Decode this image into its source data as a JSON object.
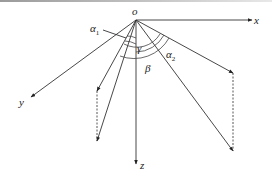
{
  "diagram": {
    "origin": {
      "label": "o",
      "x": 136,
      "y": 20
    },
    "axes": [
      {
        "name": "x",
        "label": "x",
        "to": [
          252,
          20
        ],
        "label_pos": [
          256,
          24
        ]
      },
      {
        "name": "y",
        "label": "y",
        "to": [
          31,
          97
        ],
        "label_pos": [
          20,
          106
        ]
      },
      {
        "name": "z",
        "label": "z",
        "to": [
          136,
          164
        ],
        "label_pos": [
          141,
          170
        ]
      }
    ],
    "angles": {
      "alpha1": {
        "label": "α",
        "sub": "1",
        "label_pos": [
          92,
          32
        ]
      },
      "gamma": {
        "label": "γ",
        "label_pos": [
          137,
          52
        ]
      },
      "alpha2": {
        "label": "α",
        "sub": "2",
        "label_pos": [
          178,
          59
        ]
      },
      "beta": {
        "label": "β",
        "label_pos": [
          143,
          73
        ]
      }
    },
    "vectors": [
      {
        "name": "left-upper",
        "to": [
          97,
          91
        ]
      },
      {
        "name": "left-lower",
        "to": [
          97,
          141
        ]
      },
      {
        "name": "right-upper",
        "to": [
          233,
          73
        ]
      },
      {
        "name": "right-lower",
        "to": [
          233,
          151
        ]
      }
    ],
    "projections": [
      {
        "name": "left-dashed",
        "from": [
          97,
          91
        ],
        "to": [
          97,
          141
        ]
      },
      {
        "name": "right-dashed",
        "from": [
          233,
          73
        ],
        "to": [
          233,
          151
        ]
      }
    ],
    "colors": {
      "line": "#333333",
      "background": "#ffffff"
    }
  }
}
